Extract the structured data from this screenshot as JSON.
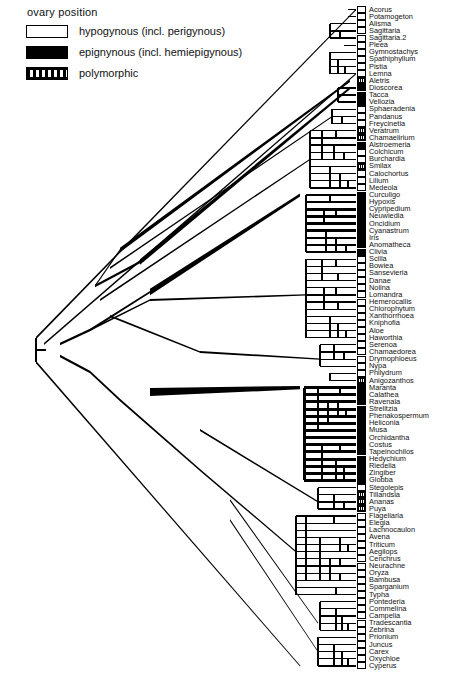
{
  "legend": {
    "title": "ovary  position",
    "items": [
      {
        "state": "open",
        "label": "hypogynous  (incl.  perigynous)"
      },
      {
        "state": "filled",
        "label": "epignynous  (incl.  hemiepigynous)"
      },
      {
        "state": "poly",
        "label": "polymorphic"
      }
    ]
  },
  "colors": {
    "line": "#000000",
    "open_fill": "#ffffff",
    "filled_fill": "#000000",
    "text": "#111111",
    "background": "#ffffff"
  },
  "chart_data": {
    "type": "tree",
    "title": "",
    "note": "Phylogenetic cladogram of monocots with ovary position character states mapped on branches",
    "states": [
      "hypogynous",
      "epigynous",
      "polymorphic"
    ],
    "taxa": [
      {
        "name": "Acorus",
        "state": "open"
      },
      {
        "name": "Potamogeton",
        "state": "open"
      },
      {
        "name": "Alisma",
        "state": "open"
      },
      {
        "name": "Sagittaria",
        "state": "open"
      },
      {
        "name": "Sagittaria.2",
        "state": "open"
      },
      {
        "name": "Pleea",
        "state": "open"
      },
      {
        "name": "Gymnostachys",
        "state": "open"
      },
      {
        "name": "Spathiphyllum",
        "state": "open"
      },
      {
        "name": "Pistia",
        "state": "open"
      },
      {
        "name": "Lemna",
        "state": "open"
      },
      {
        "name": "Aletris",
        "state": "poly"
      },
      {
        "name": "Dioscorea",
        "state": "filled"
      },
      {
        "name": "Tacca",
        "state": "filled"
      },
      {
        "name": "Vellozia",
        "state": "filled"
      },
      {
        "name": "Sphaeradenia",
        "state": "open"
      },
      {
        "name": "Pandanus",
        "state": "open"
      },
      {
        "name": "Freycinetia",
        "state": "open"
      },
      {
        "name": "Veratrum",
        "state": "poly"
      },
      {
        "name": "Chamaelirium",
        "state": "poly"
      },
      {
        "name": "Alstroemeria",
        "state": "filled"
      },
      {
        "name": "Colchicum",
        "state": "open"
      },
      {
        "name": "Burchardia",
        "state": "open"
      },
      {
        "name": "Smilax",
        "state": "poly"
      },
      {
        "name": "Calochortus",
        "state": "open"
      },
      {
        "name": "Lilium",
        "state": "open"
      },
      {
        "name": "Medeola",
        "state": "open"
      },
      {
        "name": "Curculigo",
        "state": "filled"
      },
      {
        "name": "Hypoxis",
        "state": "filled"
      },
      {
        "name": "Cypripedium",
        "state": "filled"
      },
      {
        "name": "Neuwiedia",
        "state": "filled"
      },
      {
        "name": "Oncidium",
        "state": "filled"
      },
      {
        "name": "Cyanastrum",
        "state": "filled"
      },
      {
        "name": "Iris",
        "state": "filled"
      },
      {
        "name": "Anomatheca",
        "state": "filled"
      },
      {
        "name": "Clivia",
        "state": "filled"
      },
      {
        "name": "Scilla",
        "state": "open"
      },
      {
        "name": "Bowiea",
        "state": "open"
      },
      {
        "name": "Sansevieria",
        "state": "open"
      },
      {
        "name": "Danae",
        "state": "open"
      },
      {
        "name": "Nolina",
        "state": "open"
      },
      {
        "name": "Lomandra",
        "state": "open"
      },
      {
        "name": "Hemerocallis",
        "state": "open"
      },
      {
        "name": "Chlorophytum",
        "state": "open"
      },
      {
        "name": "Xanthorrhoea",
        "state": "open"
      },
      {
        "name": "Kniphofia",
        "state": "open"
      },
      {
        "name": "Aloe",
        "state": "open"
      },
      {
        "name": "Haworthia",
        "state": "open"
      },
      {
        "name": "Serenoa",
        "state": "open"
      },
      {
        "name": "Chamaedorea",
        "state": "open"
      },
      {
        "name": "Drymophloeus",
        "state": "open"
      },
      {
        "name": "Nypa",
        "state": "open"
      },
      {
        "name": "Philydrum",
        "state": "open"
      },
      {
        "name": "Anigozanthos",
        "state": "poly"
      },
      {
        "name": "Maranta",
        "state": "filled"
      },
      {
        "name": "Calathea",
        "state": "filled"
      },
      {
        "name": "Ravenala",
        "state": "filled"
      },
      {
        "name": "Strelitzia",
        "state": "filled"
      },
      {
        "name": "Phenakospermum",
        "state": "filled"
      },
      {
        "name": "Heliconia",
        "state": "filled"
      },
      {
        "name": "Musa",
        "state": "filled"
      },
      {
        "name": "Orchidantha",
        "state": "filled"
      },
      {
        "name": "Costus",
        "state": "filled"
      },
      {
        "name": "Tapeinochilos",
        "state": "filled"
      },
      {
        "name": "Hedychium",
        "state": "filled"
      },
      {
        "name": "Riedelia",
        "state": "filled"
      },
      {
        "name": "Zingiber",
        "state": "filled"
      },
      {
        "name": "Globba",
        "state": "filled"
      },
      {
        "name": "Stegolepis",
        "state": "open"
      },
      {
        "name": "Tillandsia",
        "state": "poly"
      },
      {
        "name": "Ananas",
        "state": "poly"
      },
      {
        "name": "Puya",
        "state": "poly"
      },
      {
        "name": "Flagellaria",
        "state": "open"
      },
      {
        "name": "Elegia",
        "state": "open"
      },
      {
        "name": "Lachnocaulon",
        "state": "open"
      },
      {
        "name": "Avena",
        "state": "open"
      },
      {
        "name": "Triticum",
        "state": "open"
      },
      {
        "name": "Aegilops",
        "state": "open"
      },
      {
        "name": "Cenchrus",
        "state": "open"
      },
      {
        "name": "Neurachne",
        "state": "open"
      },
      {
        "name": "Oryza",
        "state": "open"
      },
      {
        "name": "Bambusa",
        "state": "open"
      },
      {
        "name": "Sparganium",
        "state": "open"
      },
      {
        "name": "Typha",
        "state": "open"
      },
      {
        "name": "Pontederia",
        "state": "open"
      },
      {
        "name": "Commelina",
        "state": "open"
      },
      {
        "name": "Campelia",
        "state": "open"
      },
      {
        "name": "Tradescantia",
        "state": "open"
      },
      {
        "name": "Zebrina",
        "state": "open"
      },
      {
        "name": "Prionium",
        "state": "open"
      },
      {
        "name": "Juncus",
        "state": "open"
      },
      {
        "name": "Carex",
        "state": "open"
      },
      {
        "name": "Oxychloe",
        "state": "open"
      },
      {
        "name": "Cyperus",
        "state": "open"
      }
    ]
  }
}
